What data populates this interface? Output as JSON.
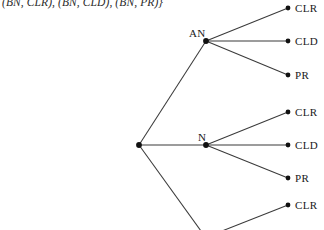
{
  "figure": {
    "caption": "(BN, CLR), (BN, CLD), (BN, PR)}",
    "line_color": "#3a3a3a",
    "node_color": "#111111",
    "text_color": "#1a1a1a",
    "background": "#ffffff"
  },
  "nodes": {
    "root": {
      "label": "",
      "x": 139,
      "y": 145
    },
    "an": {
      "label": "AN",
      "x": 206,
      "y": 41,
      "label_x": 189,
      "label_y": 27
    },
    "n": {
      "label": "N",
      "x": 206,
      "y": 145,
      "label_x": 198,
      "label_y": 131
    }
  },
  "leaves": [
    {
      "label": "CLR",
      "x": 288,
      "y": 8,
      "parent": "an",
      "label_x": 295,
      "label_y": 2
    },
    {
      "label": "CLD",
      "x": 288,
      "y": 41,
      "parent": "an",
      "label_x": 295,
      "label_y": 35
    },
    {
      "label": "PR",
      "x": 288,
      "y": 75,
      "parent": "an",
      "label_x": 295,
      "label_y": 69
    },
    {
      "label": "CLR",
      "x": 288,
      "y": 112,
      "parent": "n",
      "label_x": 295,
      "label_y": 106
    },
    {
      "label": "CLD",
      "x": 288,
      "y": 145,
      "parent": "n",
      "label_x": 295,
      "label_y": 139
    },
    {
      "label": "PR",
      "x": 288,
      "y": 178,
      "parent": "n",
      "label_x": 295,
      "label_y": 172
    },
    {
      "label": "CLR",
      "x": 288,
      "y": 205,
      "parent": "offscreen",
      "label_x": 295,
      "label_y": 199
    }
  ],
  "edges": [
    {
      "name": "root-to-an",
      "x1": 139,
      "y1": 145,
      "x2": 206,
      "y2": 41
    },
    {
      "name": "root-to-n",
      "x1": 139,
      "y1": 145,
      "x2": 206,
      "y2": 145
    },
    {
      "name": "root-to-third-subtree",
      "x1": 139,
      "y1": 145,
      "x2": 201,
      "y2": 231
    },
    {
      "name": "an-to-clr",
      "x1": 206,
      "y1": 41,
      "x2": 288,
      "y2": 8
    },
    {
      "name": "an-to-cld",
      "x1": 206,
      "y1": 41,
      "x2": 288,
      "y2": 41
    },
    {
      "name": "an-to-pr",
      "x1": 206,
      "y1": 41,
      "x2": 288,
      "y2": 75
    },
    {
      "name": "n-to-clr",
      "x1": 206,
      "y1": 145,
      "x2": 288,
      "y2": 112
    },
    {
      "name": "n-to-cld",
      "x1": 206,
      "y1": 145,
      "x2": 288,
      "y2": 145
    },
    {
      "name": "n-to-pr",
      "x1": 206,
      "y1": 145,
      "x2": 288,
      "y2": 178
    },
    {
      "name": "offscreen-to-clr",
      "x1": 222,
      "y1": 231,
      "x2": 288,
      "y2": 205
    }
  ]
}
